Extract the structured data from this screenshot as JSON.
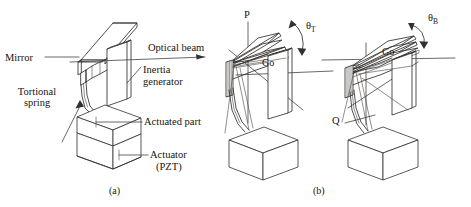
{
  "figure": {
    "kind": "technical-line-diagram",
    "title_visible": false,
    "background_color": "#ffffff",
    "line_color": "#33302e",
    "panels": [
      {
        "id": "a",
        "caption": "(a)",
        "description": "Undeflected torsional micro-mirror scanner on PZT actuator",
        "labels": [
          {
            "name": "mirror",
            "text": "Mirror"
          },
          {
            "name": "tortional-spring",
            "text_line1": "Tortional",
            "text_line2": "spring"
          },
          {
            "name": "optical-beam",
            "text": "Optical beam"
          },
          {
            "name": "inertia-generator",
            "text_line1": "Inertia",
            "text_line2": "generator"
          },
          {
            "name": "actuated-part",
            "text": "Actuated part"
          },
          {
            "name": "actuator-pzt",
            "text_line1": "Actuator",
            "text_line2": "(PZT)"
          }
        ]
      },
      {
        "id": "b-torsion",
        "caption": "(b)",
        "description": "Torsional deflection mode about axis P through angle theta-T",
        "labels": [
          {
            "name": "axis-p",
            "text": "P"
          },
          {
            "name": "center-go",
            "text": "Go"
          },
          {
            "name": "angle-theta-t",
            "symbol": "θ",
            "subscript": "T"
          }
        ]
      },
      {
        "id": "b-bending",
        "caption": "(b)",
        "description": "Bending deflection mode about axis Q through angle theta-B",
        "labels": [
          {
            "name": "axis-q",
            "text": "Q"
          },
          {
            "name": "center-go",
            "text": "Go"
          },
          {
            "name": "angle-theta-b",
            "symbol": "θ",
            "subscript": "B"
          }
        ]
      }
    ],
    "captions": [
      {
        "name": "caption-a",
        "text": "(a)"
      },
      {
        "name": "caption-b",
        "text": "(b)"
      }
    ]
  }
}
